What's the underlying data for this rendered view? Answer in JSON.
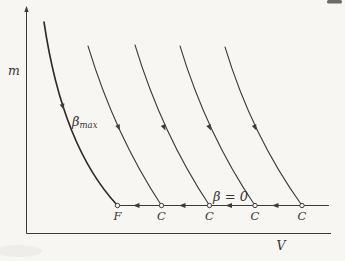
{
  "figure": {
    "title_semantic": "m-V diagram with family of beta-curves terminating on a horizontal line",
    "colors": {
      "paper": "#f7f6f3",
      "ink": "#3e3b36",
      "thick_ink": "#2e2b27",
      "artifact": "#55524e"
    },
    "axes": {
      "y_label": "m",
      "x_label": "V",
      "axis_x": 26.5,
      "axis_y": 233.5,
      "y_top": 12,
      "x_right": 331,
      "y_label_pos": {
        "x": 14,
        "y": 75
      },
      "x_label_pos": {
        "x": 281,
        "y": 250
      }
    },
    "phase_line": {
      "y": 205.5,
      "x_start": 117.5,
      "x_end": 329,
      "width": 1.2
    },
    "points": [
      {
        "label": "F",
        "x": 117.5
      },
      {
        "label": "C",
        "x": 161.5
      },
      {
        "label": "C",
        "x": 209.5
      },
      {
        "label": "C",
        "x": 255
      },
      {
        "label": "C",
        "x": 302
      }
    ],
    "point_label_y": 220,
    "point_radius": 2.2,
    "line_arrows": [
      {
        "x": 139.5,
        "y": 205.5,
        "angle": 180
      },
      {
        "x": 185.5,
        "y": 205.5,
        "angle": 180
      },
      {
        "x": 232,
        "y": 205.5,
        "angle": 180
      },
      {
        "x": 278.5,
        "y": 205.5,
        "angle": 180
      }
    ],
    "curves": [
      {
        "name": "beta-max-curve",
        "d": "M44,22 C54,90 75,160 117.5,205.5",
        "width": 1.7,
        "thick": true
      },
      {
        "name": "beta-curve-2",
        "d": "M88,46 Q115,135 161.5,205.5",
        "width": 1.05,
        "thick": false
      },
      {
        "name": "beta-curve-3",
        "d": "M135,45 Q162,134 209.5,205.5",
        "width": 1.05,
        "thick": false
      },
      {
        "name": "beta-curve-4",
        "d": "M180,46 Q207,135 255,205.5",
        "width": 1.05,
        "thick": false
      },
      {
        "name": "beta-curve-5",
        "d": "M225,47 Q252,136 302,205.5",
        "width": 1.05,
        "thick": false
      }
    ],
    "curve_arrows": [
      {
        "x": 62,
        "y": 104,
        "angle": 72
      },
      {
        "x": 117.5,
        "y": 125,
        "angle": 66
      },
      {
        "x": 163,
        "y": 125,
        "angle": 66
      },
      {
        "x": 208.5,
        "y": 125,
        "angle": 66
      },
      {
        "x": 254,
        "y": 125,
        "angle": 66
      }
    ],
    "annotations": {
      "beta_max": {
        "main": "β",
        "sub": "max",
        "x": 72,
        "y": 126
      },
      "beta_zero": {
        "text": "β = 0",
        "x": 213,
        "y": 201
      }
    },
    "artifact": {
      "x": 327,
      "y": 0,
      "width": 15,
      "height": 3.5
    }
  }
}
